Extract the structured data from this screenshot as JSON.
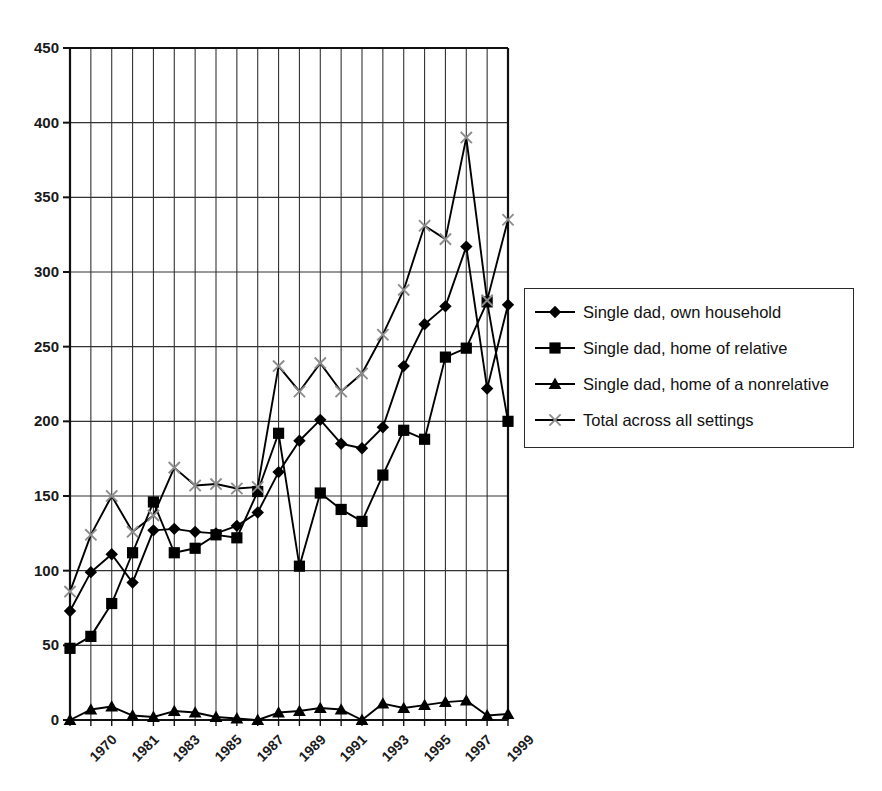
{
  "chart_data": {
    "type": "line",
    "title": "",
    "xlabel": "",
    "ylabel": "",
    "ylim": [
      0,
      450
    ],
    "ytick_step": 50,
    "yticks": [
      0,
      50,
      100,
      150,
      200,
      250,
      300,
      350,
      400,
      450
    ],
    "grid": true,
    "grid_vertical": true,
    "grid_horizontal": true,
    "legend_position": "right",
    "x": [
      "1970",
      "1980",
      "1981",
      "1982",
      "1983",
      "1984",
      "1985",
      "1986",
      "1987",
      "1988",
      "1989",
      "1990",
      "1991",
      "1992",
      "1993",
      "1994",
      "1995",
      "1996",
      "1997",
      "1998",
      "1999",
      "2000"
    ],
    "xtick_labels": [
      "1970",
      "1981",
      "1983",
      "1985",
      "1987",
      "1989",
      "1991",
      "1993",
      "1995",
      "1997",
      "1999"
    ],
    "xtick_indices": [
      0,
      2,
      4,
      6,
      8,
      10,
      12,
      14,
      16,
      18,
      20
    ],
    "series": [
      {
        "name": "Single dad, own household",
        "marker": "diamond",
        "color": "#000000",
        "values": [
          73,
          99,
          111,
          92,
          127,
          128,
          126,
          125,
          130,
          139,
          166,
          187,
          201,
          185,
          182,
          196,
          237,
          265,
          277,
          317,
          222,
          278
        ]
      },
      {
        "name": "Single dad, home of relative",
        "marker": "square",
        "color": "#000000",
        "values": [
          48,
          56,
          78,
          112,
          146,
          112,
          115,
          124,
          122,
          153,
          192,
          103,
          152,
          141,
          133,
          164,
          194,
          188,
          243,
          249,
          280,
          200
        ]
      },
      {
        "name": "Single dad, home of a nonrelative",
        "marker": "triangle",
        "color": "#000000",
        "values": [
          0,
          7,
          9,
          3,
          2,
          6,
          5,
          2,
          1,
          0,
          5,
          6,
          8,
          7,
          0,
          11,
          8,
          10,
          12,
          13,
          3,
          4
        ]
      },
      {
        "name": "Total across all settings",
        "marker": "cross",
        "color": "#8c8c8c",
        "values": [
          86,
          124,
          150,
          126,
          137,
          169,
          157,
          158,
          155,
          156,
          237,
          220,
          239,
          220,
          232,
          258,
          288,
          331,
          322,
          390,
          281,
          335
        ]
      }
    ]
  }
}
